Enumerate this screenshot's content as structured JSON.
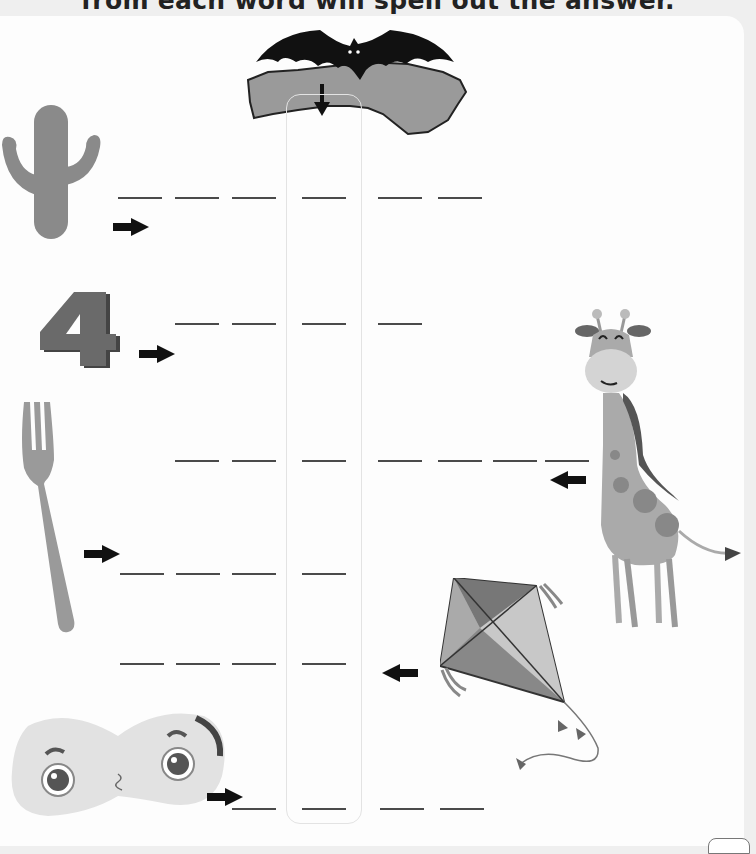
{
  "instruction": "from each word will spell out the answer.",
  "header_clue": {
    "icon": "bat-over-australia-icon",
    "pointer": "down-arrow-icon"
  },
  "colors": {
    "background": "#efefef",
    "card": "#fdfdfd",
    "ink": "#222222",
    "blank": "#4a4a4a",
    "column_border": "#e3e3e3"
  },
  "rows": [
    {
      "picture": "cactus",
      "direction": "right",
      "letter_count": 6,
      "highlighted_index": 4
    },
    {
      "picture": "number-four",
      "direction": "right",
      "letter_count": 4,
      "highlighted_index": 3
    },
    {
      "picture": "fork",
      "direction": "left",
      "letter_count": 7,
      "highlighted_index": 3,
      "answer_source_side": "giraffe"
    },
    {
      "picture": "fork",
      "direction": "right",
      "letter_count": 4,
      "highlighted_index": 4
    },
    {
      "picture": "kite",
      "direction": "left",
      "letter_count": 4,
      "highlighted_index": 4
    },
    {
      "picture": "peanut",
      "direction": "right",
      "letter_count": 4,
      "highlighted_index": 2
    }
  ],
  "side_pictures": [
    "giraffe",
    "kite"
  ]
}
